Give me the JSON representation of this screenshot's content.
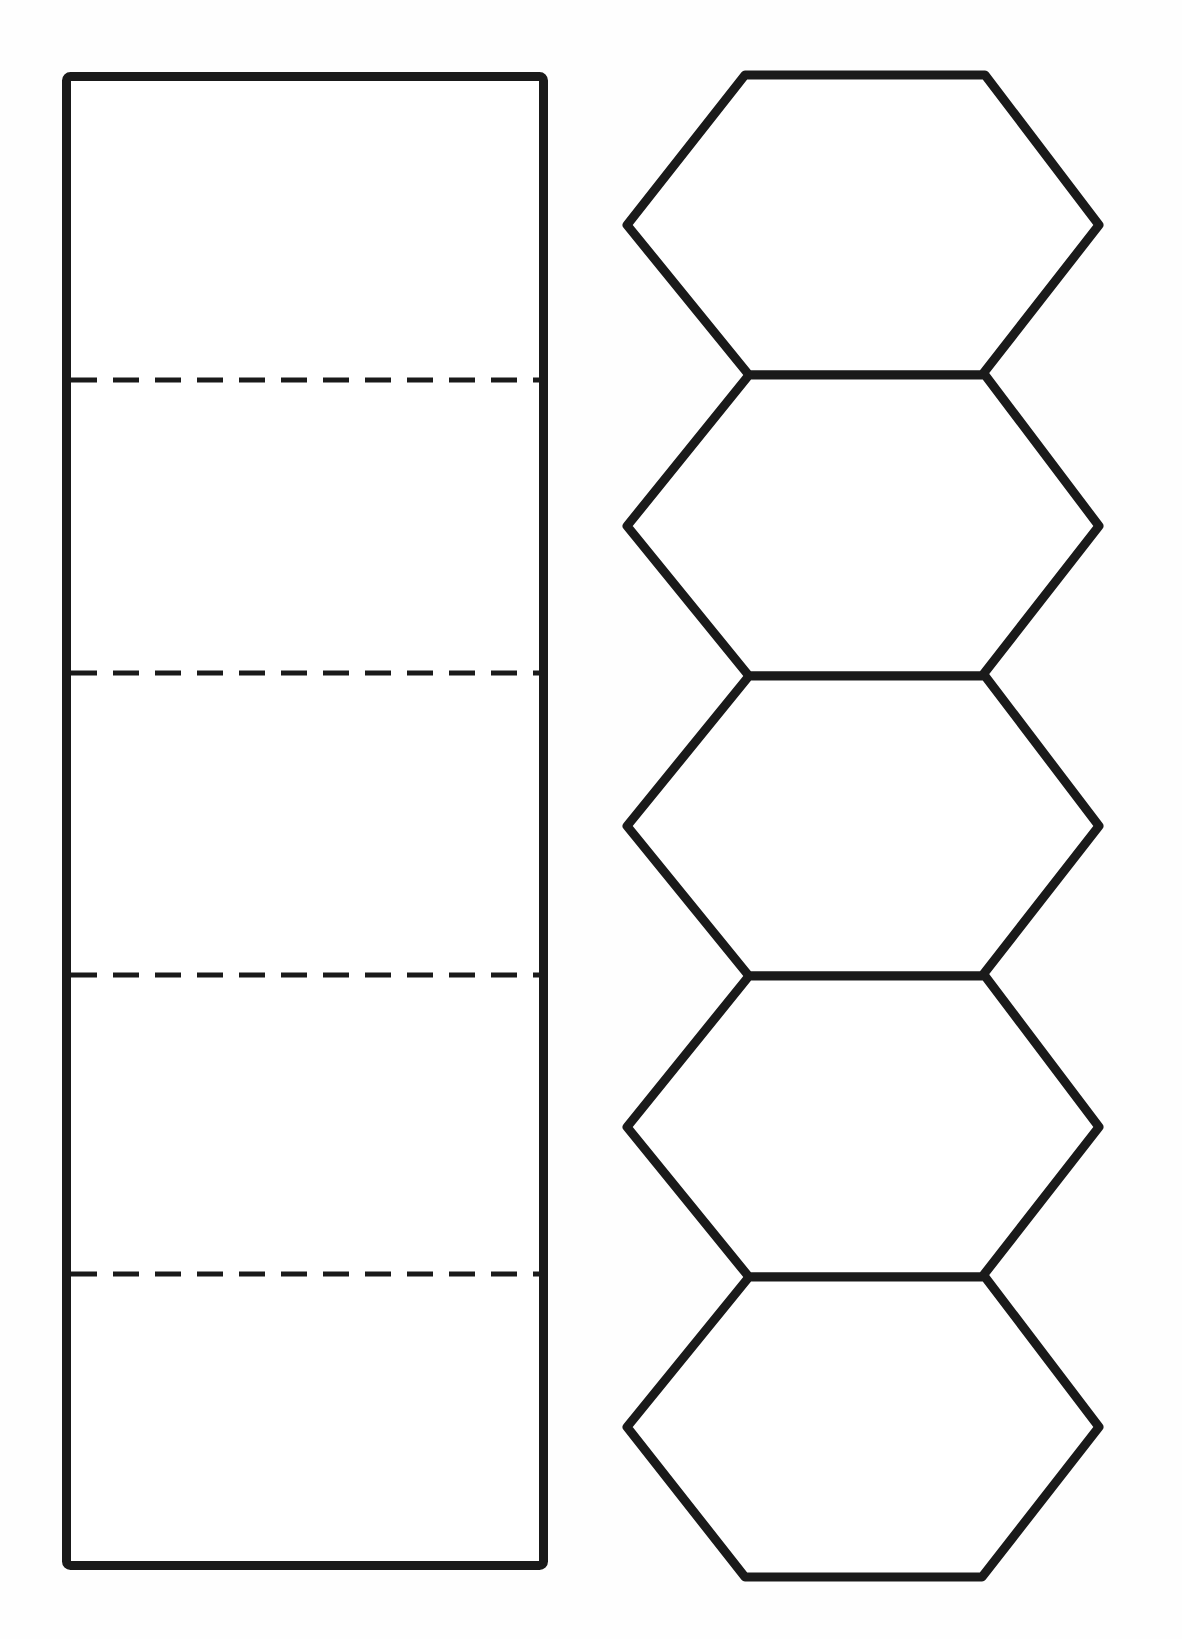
{
  "page": {
    "width": 1182,
    "height": 1639,
    "background_color": "#fefefe"
  },
  "style": {
    "stroke_color": "#1a1a1a",
    "stroke_width": 9,
    "dash_color": "#1a1a1a",
    "dash_width": 5,
    "dash_pattern": "26 16",
    "fill_color": "#ffffff"
  },
  "figures": [
    {
      "name": "rectangle-net",
      "label": "Rectangle strip net",
      "shape": "rectangle",
      "x": 62,
      "y": 72,
      "width": 486,
      "height": 1498,
      "panel_count": 5,
      "fold_lines_y": [
        380,
        673,
        975,
        1274
      ]
    },
    {
      "name": "hexagon-strip-net",
      "label": "Hexagon strip net",
      "shape": "hexagon-column",
      "hexagon_count": 5,
      "top_y": 75,
      "bottom_y": 1577,
      "flat_edge_left_x": 745,
      "flat_edge_right_x": 985,
      "outer_vertex_left_x": 627,
      "outer_vertex_right_x": 1099,
      "waist_vertex_left_x": 749,
      "waist_vertex_right_x": 982,
      "fold_lines_y": [
        375,
        676,
        976,
        1277
      ]
    }
  ],
  "chart_data": {
    "type": "diagram",
    "series": [
      {
        "name": "rectangle-net",
        "fold_lines_y": [
          380,
          673,
          975,
          1274
        ],
        "panel_heights": [
          308,
          293,
          302,
          299,
          296
        ]
      },
      {
        "name": "hexagon-strip-net",
        "fold_lines_y": [
          375,
          676,
          976,
          1277
        ],
        "panel_heights": [
          300,
          301,
          300,
          301,
          300
        ]
      }
    ]
  }
}
